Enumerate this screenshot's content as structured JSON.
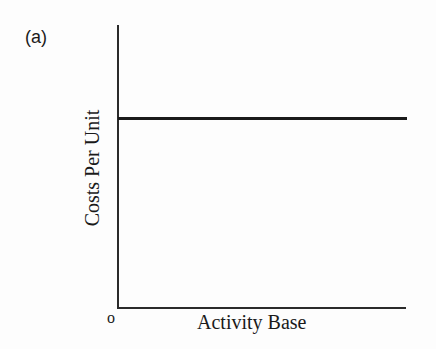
{
  "figure": {
    "panel_label": "(a)",
    "origin_label": "o",
    "x_axis_label": "Activity Base",
    "y_axis_label": "Costs Per Unit",
    "colors": {
      "axis": "#2a2a2a",
      "line": "#1a1a1a",
      "background": "#fdfdfd"
    }
  },
  "chart_data": {
    "type": "line",
    "title": "(a)",
    "xlabel": "Activity Base",
    "ylabel": "Costs Per Unit",
    "x_tick_labels": [
      "o"
    ],
    "y_tick_labels": [],
    "xlim": [
      0,
      1
    ],
    "ylim": [
      0,
      1
    ],
    "grid": false,
    "legend": null,
    "series": [
      {
        "name": "Costs Per Unit",
        "x": [
          0,
          1
        ],
        "y": [
          0.67,
          0.67
        ],
        "description": "Horizontal line — constant cost per unit across activity base"
      }
    ]
  }
}
